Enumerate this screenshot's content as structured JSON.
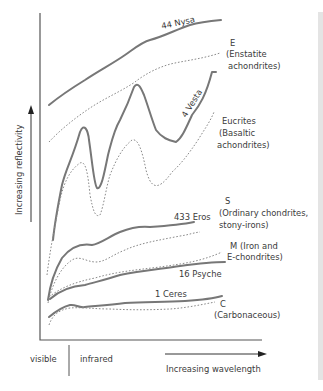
{
  "diagram": {
    "y_axis_label": "Increasing reflectivity",
    "x_axis_label": "Increasing wavelength",
    "region_labels": {
      "left": "visible",
      "right": "infrared"
    },
    "asteroids": [
      {
        "name": "44 Nysa",
        "class_letter": "E",
        "class_desc_1": "(Enstatite",
        "class_desc_2": "achondrites)"
      },
      {
        "name": "4 Vesta",
        "class_letter": "Eucrites",
        "class_desc_1": "(Basaltic",
        "class_desc_2": "achondrites)"
      },
      {
        "name": "433 Eros",
        "class_letter": "S",
        "class_desc_1": "(Ordinary chondrites,",
        "class_desc_2": "stony-irons)"
      },
      {
        "name": "16 Psyche",
        "class_letter": "M",
        "class_desc_1": "(Iron and",
        "class_desc_2": "E-chondrites)"
      },
      {
        "name": "1 Ceres",
        "class_letter": "C",
        "class_desc_1": "(Carbonaceous)",
        "class_desc_2": ""
      }
    ],
    "legend_note": {
      "solid": "asteroid spectrum",
      "dotted": "meteorite class spectrum"
    },
    "colors": {
      "solid_curve": "#777777",
      "dotted_curve": "#8a8a8a",
      "axis": "#555555",
      "text": "#3a3a3a"
    }
  }
}
